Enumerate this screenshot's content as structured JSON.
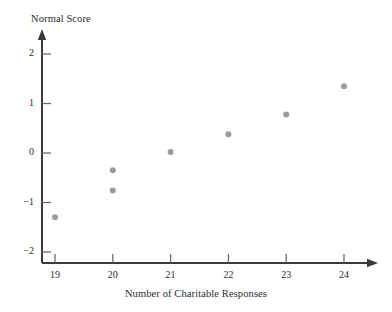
{
  "chart_data": {
    "type": "scatter",
    "title": "",
    "xlabel": "Number of Charitable Responses",
    "ylabel": "Normal Score",
    "xlim": [
      18.35,
      24.6
    ],
    "ylim": [
      -2.2,
      2.35
    ],
    "xticks": [
      19,
      20,
      21,
      22,
      23,
      24
    ],
    "xtick_labels": [
      "19",
      "20",
      "21",
      "22",
      "23",
      "24"
    ],
    "yticks": [
      -2,
      -1,
      0,
      1,
      2
    ],
    "ytick_labels": [
      "−2",
      "−1",
      "0",
      "1",
      "2"
    ],
    "grid": false,
    "legend": null,
    "axis_arrows": {
      "x": "right",
      "y": "up"
    },
    "marker": {
      "shape": "circle",
      "color": "#9b9b9b",
      "size_px": 6
    },
    "points": [
      {
        "x": 19,
        "y": -1.3
      },
      {
        "x": 20,
        "y": -0.35
      },
      {
        "x": 20,
        "y": -0.76
      },
      {
        "x": 21,
        "y": 0.02
      },
      {
        "x": 22,
        "y": 0.38
      },
      {
        "x": 23,
        "y": 0.78
      },
      {
        "x": 24,
        "y": 1.35
      }
    ]
  },
  "style": {
    "axis_color": "#3a3a3a",
    "tick_color": "#6b6b6b",
    "marker_color": "#9b9b9b",
    "text_color": "#2b2b2b",
    "background": "#ffffff"
  }
}
